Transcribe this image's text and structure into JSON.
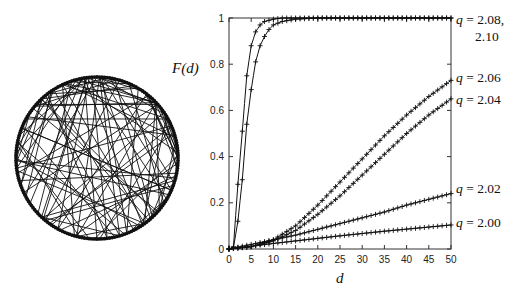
{
  "chart_data": [
    {
      "type": "graph",
      "name": "ring network with random long-range links",
      "layout": "circle",
      "nodes_on_ring": 200,
      "description": "Nodes arranged on a circle; neighbours linked along the ring plus random shortcut chords across the interior"
    },
    {
      "type": "line",
      "title": "",
      "xlabel": "d",
      "ylabel": "F(d)",
      "xlim": [
        0,
        50
      ],
      "ylim": [
        0,
        1
      ],
      "xticks": [
        0,
        5,
        10,
        15,
        20,
        25,
        30,
        35,
        40,
        45,
        50
      ],
      "yticks": [
        0,
        0.2,
        0.4,
        0.6,
        0.8,
        1
      ],
      "ytick_labels": [
        "0",
        "0.2",
        "0.4",
        "0.6",
        "0.8",
        "1"
      ],
      "xtick_labels": [
        "0",
        "5",
        "10",
        "15",
        "20",
        "25",
        "30",
        "35",
        "40",
        "45",
        "50"
      ],
      "grid": false,
      "markers": "+",
      "series": [
        {
          "name": "q = 2.10",
          "label_group": "q = 2.08, 2.10",
          "x": [
            0,
            1,
            2,
            3,
            4,
            5,
            6,
            7,
            8,
            9,
            10,
            12,
            15,
            20,
            30,
            40,
            50
          ],
          "values": [
            0,
            0.01,
            0.28,
            0.51,
            0.75,
            0.88,
            0.94,
            0.97,
            0.985,
            0.99,
            0.995,
            1,
            1,
            1,
            1,
            1,
            1
          ]
        },
        {
          "name": "q = 2.08",
          "label_group": "q = 2.08, 2.10",
          "x": [
            0,
            1,
            2,
            3,
            4,
            5,
            6,
            7,
            8,
            9,
            10,
            12,
            15,
            20,
            30,
            40,
            50
          ],
          "values": [
            0,
            0.005,
            0.12,
            0.3,
            0.54,
            0.69,
            0.81,
            0.88,
            0.92,
            0.95,
            0.97,
            0.985,
            0.995,
            1,
            1,
            1,
            1
          ]
        },
        {
          "name": "q = 2.06",
          "x": [
            0,
            5,
            10,
            15,
            20,
            25,
            30,
            35,
            40,
            45,
            50
          ],
          "values": [
            0,
            0.01,
            0.04,
            0.1,
            0.19,
            0.29,
            0.39,
            0.49,
            0.58,
            0.66,
            0.73
          ]
        },
        {
          "name": "q = 2.04",
          "x": [
            0,
            5,
            10,
            15,
            20,
            25,
            30,
            35,
            40,
            45,
            50
          ],
          "values": [
            0,
            0.01,
            0.035,
            0.08,
            0.15,
            0.23,
            0.32,
            0.41,
            0.5,
            0.58,
            0.65
          ]
        },
        {
          "name": "q = 2.02",
          "x": [
            0,
            5,
            10,
            15,
            20,
            25,
            30,
            35,
            40,
            45,
            50
          ],
          "values": [
            0,
            0.02,
            0.04,
            0.06,
            0.085,
            0.11,
            0.135,
            0.16,
            0.19,
            0.215,
            0.24
          ]
        },
        {
          "name": "q = 2.00",
          "x": [
            0,
            5,
            10,
            15,
            20,
            25,
            30,
            35,
            40,
            45,
            50
          ],
          "values": [
            0,
            0.012,
            0.024,
            0.035,
            0.046,
            0.057,
            0.067,
            0.077,
            0.086,
            0.095,
            0.104
          ]
        }
      ],
      "annotations": [
        {
          "text": "q = 2.08,",
          "y_at": 1.0
        },
        {
          "text": "2.10",
          "y_at": 0.94
        },
        {
          "text": "q = 2.06",
          "y_at": 0.73
        },
        {
          "text": "q = 2.04",
          "y_at": 0.65
        },
        {
          "text": "q = 2.02",
          "y_at": 0.24
        },
        {
          "text": "q = 2.00",
          "y_at": 0.104
        }
      ]
    }
  ],
  "labels": {
    "ylabel": "F(d)",
    "xlabel": "d",
    "q_prefix": "q",
    "eq": " = ",
    "ann_0810_a": "2.08,",
    "ann_0810_b": "2.10",
    "ann_206": "2.06",
    "ann_204": "2.04",
    "ann_202": "2.02",
    "ann_200": "2.00"
  }
}
